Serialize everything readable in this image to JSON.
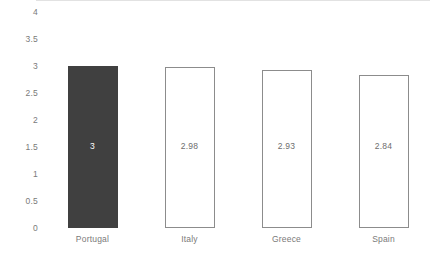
{
  "chart_data": {
    "type": "bar",
    "title": "",
    "xlabel": "",
    "ylabel": "",
    "categories": [
      "Portugal",
      "Italy",
      "Greece",
      "Spain"
    ],
    "values": [
      3,
      2.98,
      2.93,
      2.84
    ],
    "value_labels": [
      "3",
      "2.98",
      "2.93",
      "2.84"
    ],
    "series": [
      {
        "name": "",
        "values": [
          3,
          2.98,
          2.93,
          2.84
        ]
      }
    ],
    "ylim": [
      0,
      4
    ],
    "yticks": [
      0,
      0.5,
      1,
      1.5,
      2,
      2.5,
      3,
      3.5,
      4
    ],
    "ytick_labels": [
      "0",
      "0.5",
      "1",
      "1.5",
      "2",
      "2.5",
      "3",
      "3.5",
      "4"
    ],
    "grid": false,
    "legend": false,
    "legend_position": "none",
    "bar_styles": [
      "filled",
      "outlined",
      "outlined",
      "outlined"
    ],
    "colors": {
      "highlight_bar_fill": "#404040",
      "bar_fill": "#ffffff",
      "bar_border": "#8c8c8c",
      "axis_line": "#e2e2e2",
      "tick_text": "#7a7a7a",
      "label_text_light": "#ffffff",
      "label_text_dark": "#6e6e6e",
      "background": "#ffffff"
    }
  }
}
